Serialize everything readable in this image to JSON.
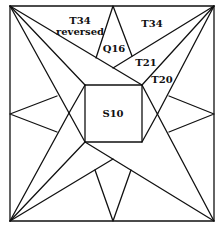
{
  "diagram": {
    "labels": {
      "t34_reversed_line1": "T34",
      "t34_reversed_line2": "reversed",
      "t34": "T34",
      "q16": "Q16",
      "t21": "T21",
      "t20": "T20",
      "s10": "S10"
    },
    "colors": {
      "line": "#111111",
      "background": "#ffffff"
    }
  }
}
